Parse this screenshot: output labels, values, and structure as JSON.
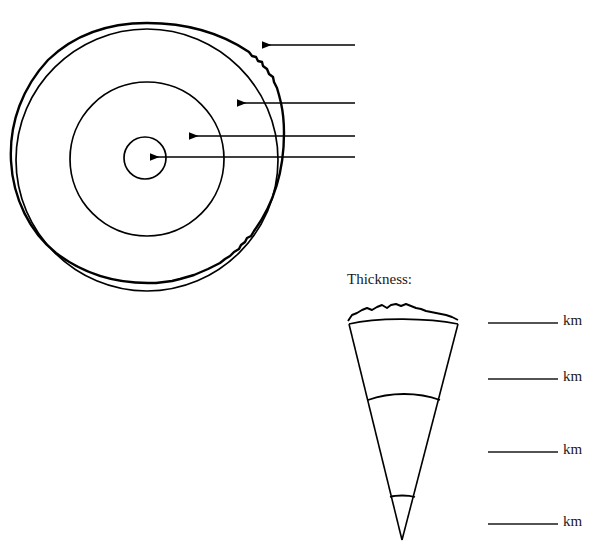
{
  "figure": {
    "background_color": "#ffffff",
    "stroke_color": "#000000"
  },
  "earth_diagram": {
    "name": "concentric-earth-layers",
    "center": {
      "x": 147,
      "y": 160
    },
    "layers": [
      {
        "name": "crust",
        "radius": 137,
        "style": "wavy-double-line"
      },
      {
        "name": "outer-shell",
        "radius": 131,
        "style": "smooth-circle"
      },
      {
        "name": "mantle",
        "radius": 77,
        "style": "smooth-circle"
      },
      {
        "name": "core",
        "radius": 21,
        "style": "smooth-circle"
      }
    ]
  },
  "callouts": {
    "name": "blank-answer-arrows",
    "line_end_x": 355,
    "items": [
      {
        "id": "callout-1",
        "tip_x": 259,
        "tip_y": 45,
        "label": "",
        "target": "crust"
      },
      {
        "id": "callout-2",
        "tip_x": 234,
        "tip_y": 103,
        "label": "",
        "target": "outer-shell"
      },
      {
        "id": "callout-3",
        "tip_x": 186,
        "tip_y": 136,
        "label": "",
        "target": "mantle"
      },
      {
        "id": "callout-4",
        "tip_x": 147,
        "tip_y": 157,
        "label": "",
        "target": "core"
      }
    ]
  },
  "wedge_diagram": {
    "name": "thickness-wedge",
    "heading": "Thickness:",
    "apex": {
      "x": 402,
      "y": 540
    },
    "top_left": {
      "x": 348,
      "y": 320
    },
    "top_right": {
      "x": 458,
      "y": 320
    },
    "divisions": [
      {
        "name": "crust-band",
        "y": 313,
        "style": "wavy-arc"
      },
      {
        "name": "upper-boundary",
        "y": 320,
        "style": "arc"
      },
      {
        "name": "mantle-boundary",
        "y": 400,
        "style": "arc"
      },
      {
        "name": "core-boundary",
        "y": 498,
        "style": "arc"
      }
    ]
  },
  "answer_blanks": {
    "name": "thickness-answer-lines",
    "unit_label": "km",
    "line_start_x": 488,
    "line_end_x": 558,
    "rows": [
      {
        "id": "blank-1",
        "y": 323,
        "value": "",
        "unit": "km"
      },
      {
        "id": "blank-2",
        "y": 379,
        "value": "",
        "unit": "km"
      },
      {
        "id": "blank-3",
        "y": 452,
        "value": "",
        "unit": "km"
      },
      {
        "id": "blank-4",
        "y": 524,
        "value": "",
        "unit": "km"
      }
    ]
  }
}
